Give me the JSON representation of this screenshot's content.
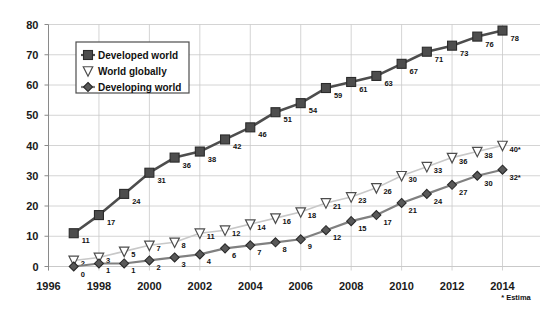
{
  "chart_data": {
    "type": "line",
    "title": "",
    "xlabel": "",
    "ylabel": "",
    "x": [
      1997,
      1998,
      1999,
      2000,
      2001,
      2002,
      2003,
      2004,
      2005,
      2006,
      2007,
      2008,
      2009,
      2010,
      2011,
      2012,
      2013,
      2014
    ],
    "xlim": [
      1996,
      2015
    ],
    "ylim": [
      0,
      80
    ],
    "ytick_labels": [
      "0",
      "10",
      "20",
      "30",
      "40",
      "50",
      "60",
      "70",
      "80"
    ],
    "ytick_values": [
      0,
      10,
      20,
      30,
      40,
      50,
      60,
      70,
      80
    ],
    "xtick_labels": [
      "1996",
      "1998",
      "2000",
      "2002",
      "2004",
      "2006",
      "2008",
      "2010",
      "2012",
      "2014"
    ],
    "xtick_values": [
      1996,
      1998,
      2000,
      2002,
      2004,
      2006,
      2008,
      2010,
      2012,
      2014
    ],
    "grid": true,
    "legend_position": "upper-left-inside",
    "series": [
      {
        "name": "Developed world",
        "marker": "square",
        "color": "#4d4d4d",
        "line_color": "#4d4d4d",
        "values": [
          11,
          17,
          24,
          31,
          36,
          38,
          42,
          46,
          51,
          54,
          59,
          61,
          63,
          67,
          71,
          73,
          76,
          78
        ],
        "labels": [
          "11",
          "17",
          "24",
          "31",
          "36",
          "38",
          "42",
          "46",
          "51",
          "54",
          "59",
          "61",
          "63",
          "67",
          "71",
          "73",
          "76",
          "78"
        ]
      },
      {
        "name": "World globally",
        "marker": "triangle-down",
        "color": "#ffffff",
        "line_color": "#c8c8c8",
        "values": [
          2,
          3,
          5,
          7,
          8,
          11,
          12,
          14,
          16,
          18,
          21,
          23,
          26,
          30,
          33,
          36,
          38,
          40
        ],
        "labels": [
          "2",
          "3",
          "5",
          "7",
          "8",
          "11",
          "12",
          "14",
          "16",
          "18",
          "21",
          "23",
          "26",
          "30",
          "33",
          "36",
          "38",
          "40*"
        ]
      },
      {
        "name": "Developing world",
        "marker": "diamond",
        "color": "#595959",
        "line_color": "#808080",
        "values": [
          0,
          1,
          1,
          2,
          3,
          4,
          6,
          7,
          8,
          9,
          12,
          15,
          17,
          21,
          24,
          27,
          30,
          32
        ],
        "labels": [
          "0",
          "1",
          "1",
          "2",
          "3",
          "4",
          "6",
          "7",
          "8",
          "9",
          "12",
          "15",
          "17",
          "21",
          "24",
          "27",
          "30",
          "32*"
        ]
      }
    ],
    "annotations": [
      {
        "name": "estimate-footnote",
        "text": "* Estima"
      }
    ]
  },
  "legend": {
    "items": [
      {
        "label": "Developed world"
      },
      {
        "label": "World globally"
      },
      {
        "label": "Developing world"
      }
    ]
  },
  "footnote": {
    "text": "* Estima"
  }
}
